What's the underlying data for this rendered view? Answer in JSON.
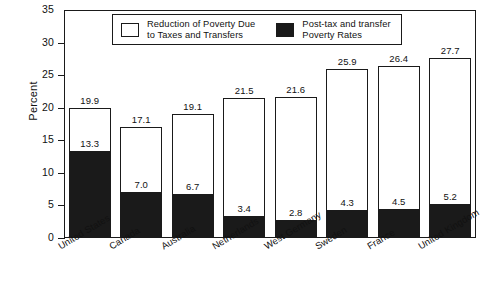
{
  "chart_data": {
    "type": "bar",
    "title": "",
    "subtitle": "",
    "xlabel": "",
    "ylabel": "Percent",
    "ylim": [
      0,
      35
    ],
    "ytick_step": 5,
    "yticks": [
      "0",
      "5",
      "10",
      "15",
      "20",
      "25",
      "30",
      "35"
    ],
    "grid": false,
    "legend_position": "top-center",
    "stacked": true,
    "categories": [
      "United States",
      "Canada",
      "Australia",
      "Netherlands",
      "West Germany",
      "Sweden",
      "France",
      "United Kingdom"
    ],
    "series": [
      {
        "name": "Reduction of Poverty Due to Taxes and Transfers",
        "style": "open",
        "color": "#ffffff",
        "note": "outer bar shows pre-tax/pre-transfer total poverty rate",
        "values": [
          19.9,
          17.1,
          19.1,
          21.5,
          21.6,
          25.9,
          26.4,
          27.7
        ]
      },
      {
        "name": "Post-tax and transfer Poverty Rates",
        "style": "filled",
        "color": "#1a1a1a",
        "values": [
          13.3,
          7.0,
          6.7,
          3.4,
          2.8,
          4.3,
          4.5,
          5.2
        ]
      }
    ],
    "total_labels": [
      "19.9",
      "17.1",
      "19.1",
      "21.5",
      "21.6",
      "25.9",
      "26.4",
      "27.7"
    ],
    "black_labels": [
      "13.3",
      "7.0",
      "6.7",
      "3.4",
      "2.8",
      "4.3",
      "4.5",
      "5.2"
    ]
  },
  "legend": {
    "entries": [
      {
        "swatch": "open-square",
        "line1": "Reduction of Poverty Due",
        "line2": "to Taxes and Transfers"
      },
      {
        "swatch": "filled-square",
        "line1": "Post-tax and transfer",
        "line2": "Poverty Rates"
      }
    ]
  },
  "axis": {
    "y_title": "Percent"
  },
  "colors": {
    "ink": "#1a1a1a",
    "fill_black": "#1a1a1a",
    "fill_white": "#ffffff",
    "background": "#ffffff"
  }
}
